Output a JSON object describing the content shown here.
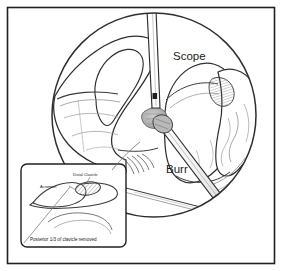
{
  "figure": {
    "frame": {
      "border_color": "#231f20",
      "background_color": "#ffffff"
    },
    "colors": {
      "ink": "#231f20",
      "line": "#3a3a3a",
      "soft_line": "#8a8a8a",
      "shade_gray": "#b5b5b5",
      "hatch_gray": "#7d7d7d",
      "white": "#ffffff"
    },
    "arthroscopic_view": {
      "name": "arthroscopic-field-circle",
      "shape": "circle"
    },
    "labels": {
      "scope": "Scope",
      "burr": "Burr"
    },
    "instruments": [
      {
        "name": "scope",
        "label": "Scope"
      },
      {
        "name": "burr",
        "label": "Burr"
      }
    ],
    "inset": {
      "name": "inset-diagram",
      "caption": "Posterior 1/3 of clavicle removed",
      "labels": {
        "distal_clavicle": "Distal Clavicle",
        "acromion": "Acromion"
      }
    }
  }
}
